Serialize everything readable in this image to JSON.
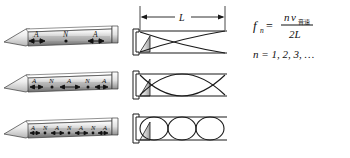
{
  "figure": {
    "background_color": "#ffffff",
    "ink_color": "#1a1a1a",
    "tube_fill_color": "#d9d9d9",
    "tube_highlight_color": "#f7f7f7",
    "driver_fill_color": "#c9c9c9"
  },
  "dimension": {
    "length_label": "L",
    "left_arrow": "arrow-left",
    "right_arrow": "arrow-right"
  },
  "formula": {
    "f_symbol": "f",
    "f_subscript": "n",
    "equals": "=",
    "numerator_n": "n",
    "numerator_v": "v",
    "numerator_v_subscript": "音速",
    "denominator": "2L",
    "n_line": "n = 1, 2, 3, …"
  },
  "rows": [
    {
      "harmonic": 1,
      "loops": 1,
      "tube_labels": [
        "A",
        "N",
        "A"
      ],
      "label_kinds": [
        "antinode",
        "node",
        "antinode"
      ],
      "node_marker_positions": [
        50
      ],
      "arrow_positions": [
        11,
        89
      ]
    },
    {
      "harmonic": 2,
      "loops": 2,
      "tube_labels": [
        "A",
        "N",
        "A",
        "N",
        "A"
      ],
      "label_kinds": [
        "antinode",
        "node",
        "antinode",
        "node",
        "antinode"
      ],
      "node_marker_positions": [
        27,
        73
      ],
      "arrow_positions": [
        11,
        50,
        89
      ]
    },
    {
      "harmonic": 3,
      "loops": 3,
      "tube_labels": [
        "A",
        "N",
        "A",
        "N",
        "A",
        "N",
        "A"
      ],
      "label_kinds": [
        "antinode",
        "node",
        "antinode",
        "node",
        "antinode",
        "node",
        "antinode"
      ],
      "node_marker_positions": [
        19,
        50,
        81
      ],
      "arrow_positions": [
        11,
        37,
        63,
        89
      ]
    }
  ],
  "legend": {
    "antinode_symbol": "A",
    "node_symbol": "N"
  }
}
